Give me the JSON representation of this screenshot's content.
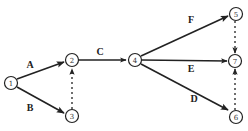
{
  "diagram": {
    "type": "activity-on-arrow network",
    "nodes": [
      {
        "id": "1",
        "label": "1",
        "x": 11,
        "y": 83
      },
      {
        "id": "2",
        "label": "2",
        "x": 72,
        "y": 60
      },
      {
        "id": "3",
        "label": "3",
        "x": 72,
        "y": 116
      },
      {
        "id": "4",
        "label": "4",
        "x": 135,
        "y": 60
      },
      {
        "id": "5",
        "label": "5",
        "x": 236,
        "y": 14
      },
      {
        "id": "7",
        "label": "7",
        "x": 235,
        "y": 61
      },
      {
        "id": "6",
        "label": "6",
        "x": 236,
        "y": 117
      }
    ],
    "edges": [
      {
        "from": "1",
        "to": "2",
        "label": "A",
        "style": "solid"
      },
      {
        "from": "1",
        "to": "3",
        "label": "B",
        "style": "solid"
      },
      {
        "from": "3",
        "to": "2",
        "label": "",
        "style": "dummy-dotted"
      },
      {
        "from": "2",
        "to": "4",
        "label": "C",
        "style": "solid"
      },
      {
        "from": "4",
        "to": "5",
        "label": "F",
        "style": "solid"
      },
      {
        "from": "4",
        "to": "7",
        "label": "E",
        "style": "solid"
      },
      {
        "from": "4",
        "to": "6",
        "label": "D",
        "style": "solid"
      },
      {
        "from": "5",
        "to": "7",
        "label": "",
        "style": "dummy-dotted"
      },
      {
        "from": "6",
        "to": "7",
        "label": "",
        "style": "dummy-dotted"
      }
    ],
    "edge_labels": {
      "A": "A",
      "B": "B",
      "C": "C",
      "D": "D",
      "E": "E",
      "F": "F"
    },
    "node_labels": {
      "n1": "1",
      "n2": "2",
      "n3": "3",
      "n4": "4",
      "n5": "5",
      "n6": "6",
      "n7": "7"
    }
  }
}
